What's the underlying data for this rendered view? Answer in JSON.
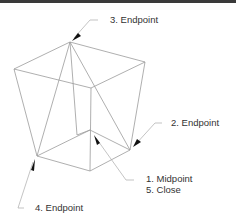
{
  "diagram": {
    "colors": {
      "lines": "#9a9a9a",
      "leaders": "#aaaaaa",
      "arrows": "#111111",
      "text": "#333333",
      "top_rule": "#3a3a3a"
    },
    "callouts": [
      {
        "id": "c3",
        "text": "3. Endpoint"
      },
      {
        "id": "c2",
        "text": "2. Endpoint"
      },
      {
        "id": "c1a",
        "text": "1. Midpoint"
      },
      {
        "id": "c1b",
        "text": "5. Close"
      },
      {
        "id": "c4",
        "text": "4. Endpoint"
      }
    ]
  }
}
